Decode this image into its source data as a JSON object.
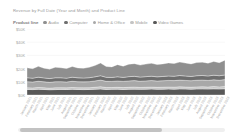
{
  "chart_data": {
    "type": "area",
    "title": "Revenue by Full Date (Year and Month) and Product Line",
    "xlabel": "",
    "ylabel": "",
    "ylim": [
      0,
      50000
    ],
    "grid": true,
    "legend_position": "top",
    "legend_caption": "Product line",
    "y_ticks": [
      "$50K",
      "$40K",
      "$30K",
      "$20K",
      "$10K",
      "$0K"
    ],
    "y_tick_values": [
      50000,
      40000,
      30000,
      20000,
      10000,
      0
    ],
    "colors": {
      "audio": "#8f8f8f",
      "computer": "#6e6e6e",
      "home_office": "#a8a8a8",
      "mobile": "#c4c4c4",
      "video_games": "#585858"
    },
    "categories": [
      "January 2021",
      "February 2021",
      "March 2021",
      "April 2021",
      "May 2021",
      "June 2021",
      "July 2021",
      "August 2021",
      "September 2021",
      "October 2021",
      "November 2021",
      "December 2021",
      "January 2022",
      "February 2022",
      "March 2022",
      "April 2022",
      "May 2022",
      "June 2022",
      "July 2022",
      "August 2022",
      "September 2022",
      "October 2022",
      "November 2022",
      "December 2022",
      "January 2023",
      "February 2023",
      "March 2023",
      "April 2023",
      "May 2023",
      "June 2023",
      "July 2023",
      "August 2023",
      "September 2023",
      "October 2023",
      "November 2023",
      "December 2023"
    ],
    "series": [
      {
        "name": "Video Games",
        "values": [
          4200,
          4100,
          4300,
          4200,
          4000,
          4100,
          4250,
          4150,
          4300,
          4200,
          4100,
          4200,
          4350,
          4500,
          4250,
          4300,
          4400,
          4200,
          4350,
          4450,
          4300,
          4400,
          4500,
          4350,
          4400,
          4500,
          4450,
          4600,
          4500,
          4400,
          4550,
          4600,
          4500,
          4650,
          4550,
          4700
        ]
      },
      {
        "name": "Mobile",
        "values": [
          1300,
          1250,
          1400,
          1300,
          1200,
          1350,
          1300,
          1250,
          1400,
          1300,
          1350,
          1300,
          1500,
          1800,
          1400,
          1350,
          1450,
          1400,
          1500,
          1550,
          1400,
          1450,
          1500,
          1450,
          1500,
          1550,
          1500,
          1600,
          1550,
          1500,
          1600,
          1650,
          1550,
          1700,
          1600,
          1750
        ]
      },
      {
        "name": "Home & Office",
        "values": [
          4600,
          4500,
          4700,
          4500,
          4400,
          4600,
          4550,
          4450,
          4700,
          4550,
          4500,
          4600,
          4800,
          5000,
          4700,
          4650,
          4800,
          4700,
          4850,
          4900,
          4750,
          4850,
          4950,
          4800,
          4900,
          5000,
          4950,
          5100,
          5000,
          4900,
          5050,
          5100,
          5000,
          5150,
          5050,
          5200
        ]
      },
      {
        "name": "Computer",
        "values": [
          3000,
          2900,
          3100,
          2950,
          2850,
          3000,
          2950,
          2900,
          3100,
          2950,
          2900,
          3000,
          3100,
          3300,
          3050,
          3000,
          3150,
          3050,
          3200,
          3250,
          3100,
          3200,
          3300,
          3150,
          3250,
          3350,
          3300,
          3450,
          3350,
          3250,
          3400,
          3450,
          3350,
          3500,
          3400,
          3550
        ]
      },
      {
        "name": "Audio",
        "values": [
          7500,
          7200,
          8200,
          7400,
          7100,
          8000,
          7600,
          7300,
          8100,
          7500,
          7400,
          7900,
          8600,
          9600,
          8200,
          8000,
          9200,
          8500,
          9400,
          9600,
          9100,
          9500,
          9800,
          9300,
          9500,
          9900,
          9600,
          10200,
          9800,
          9500,
          10000,
          10100,
          9700,
          10400,
          9900,
          11200
        ]
      }
    ],
    "legend_entries": [
      {
        "label": "Audio",
        "color": "#8f8f8f"
      },
      {
        "label": "Computer",
        "color": "#6e6e6e"
      },
      {
        "label": "Home & Office",
        "color": "#a8a8a8"
      },
      {
        "label": "Mobile",
        "color": "#c4c4c4"
      },
      {
        "label": "Video Games",
        "color": "#585858"
      }
    ]
  },
  "scrollbar": {
    "name": "horizontal-scrollbar"
  }
}
